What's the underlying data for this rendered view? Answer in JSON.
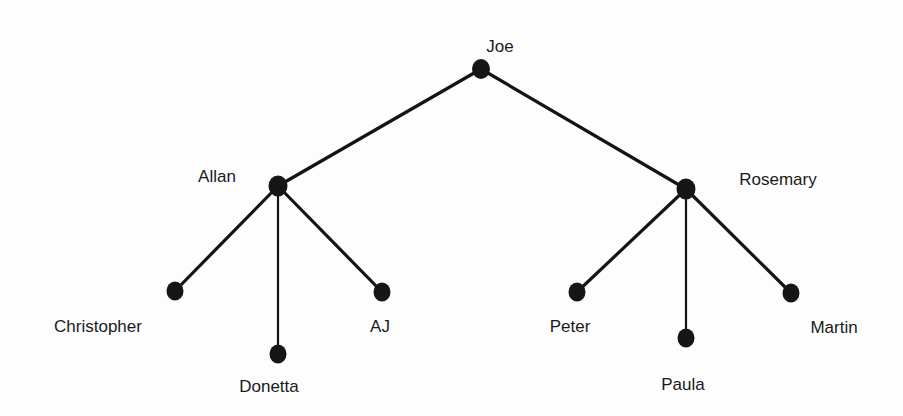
{
  "diagram": {
    "type": "family-tree",
    "background_color": "#fdfdfd",
    "node_color": "#161616",
    "edge_color": "#141414",
    "label_color": "#1a1a1a",
    "nodes": [
      {
        "id": "joe",
        "label": "Joe",
        "x": 481,
        "y": 69,
        "rx": 9,
        "ry": 10,
        "label_x": 500,
        "label_y": 52,
        "level": 0
      },
      {
        "id": "allan",
        "label": "Allan",
        "x": 278,
        "y": 186,
        "rx": 9.5,
        "ry": 10.5,
        "label_x": 217,
        "label_y": 182,
        "level": 1
      },
      {
        "id": "rosemary",
        "label": "Rosemary",
        "x": 686,
        "y": 189,
        "rx": 9.5,
        "ry": 10.5,
        "label_x": 778,
        "label_y": 185,
        "level": 1
      },
      {
        "id": "christopher",
        "label": "Christopher",
        "x": 175,
        "y": 291,
        "rx": 8.5,
        "ry": 9.5,
        "label_x": 98,
        "label_y": 332,
        "level": 2
      },
      {
        "id": "donetta",
        "label": "Donetta",
        "x": 278,
        "y": 354,
        "rx": 8.5,
        "ry": 9.5,
        "label_x": 269,
        "label_y": 392,
        "level": 2
      },
      {
        "id": "aj",
        "label": "AJ",
        "x": 382,
        "y": 292,
        "rx": 8.5,
        "ry": 9.5,
        "label_x": 380,
        "label_y": 332,
        "level": 2
      },
      {
        "id": "peter",
        "label": "Peter",
        "x": 577,
        "y": 292,
        "rx": 8.5,
        "ry": 9.5,
        "label_x": 570,
        "label_y": 332,
        "level": 2
      },
      {
        "id": "paula",
        "label": "Paula",
        "x": 686,
        "y": 338,
        "rx": 8.5,
        "ry": 9.5,
        "label_x": 683,
        "label_y": 390,
        "level": 2
      },
      {
        "id": "martin",
        "label": "Martin",
        "x": 791,
        "y": 293,
        "rx": 8.5,
        "ry": 9.5,
        "label_x": 834,
        "label_y": 333,
        "level": 2
      }
    ],
    "edges": [
      {
        "id": "joe-allan",
        "from": "joe",
        "to": "allan",
        "x1": 481,
        "y1": 69,
        "x2": 278,
        "y2": 186,
        "weight": "thick"
      },
      {
        "id": "joe-rosemary",
        "from": "joe",
        "to": "rosemary",
        "x1": 481,
        "y1": 69,
        "x2": 686,
        "y2": 189,
        "weight": "thick"
      },
      {
        "id": "allan-christopher",
        "from": "allan",
        "to": "christopher",
        "x1": 278,
        "y1": 186,
        "x2": 175,
        "y2": 291,
        "weight": "thick"
      },
      {
        "id": "allan-donetta",
        "from": "allan",
        "to": "donetta",
        "x1": 278,
        "y1": 186,
        "x2": 278,
        "y2": 354,
        "weight": "thin"
      },
      {
        "id": "allan-aj",
        "from": "allan",
        "to": "aj",
        "x1": 278,
        "y1": 186,
        "x2": 382,
        "y2": 292,
        "weight": "thick"
      },
      {
        "id": "rosemary-peter",
        "from": "rosemary",
        "to": "peter",
        "x1": 686,
        "y1": 189,
        "x2": 577,
        "y2": 292,
        "weight": "thick"
      },
      {
        "id": "rosemary-paula",
        "from": "rosemary",
        "to": "paula",
        "x1": 686,
        "y1": 189,
        "x2": 686,
        "y2": 338,
        "weight": "thin"
      },
      {
        "id": "rosemary-martin",
        "from": "rosemary",
        "to": "martin",
        "x1": 686,
        "y1": 189,
        "x2": 791,
        "y2": 293,
        "weight": "thick"
      }
    ]
  }
}
